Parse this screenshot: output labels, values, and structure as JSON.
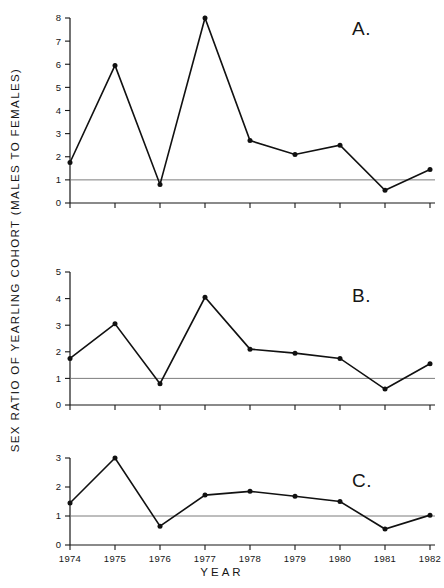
{
  "figure": {
    "ylabel": "SEX RATIO OF YEARLING COHORT (MALES TO FEMALES)",
    "xlabel": "YEAR",
    "panel_a_letter": "A.",
    "panel_b_letter": "B.",
    "panel_c_letter": "C."
  },
  "chart_data": [
    {
      "type": "line",
      "title": "A.",
      "xlabel": "YEAR",
      "ylabel": "SEX RATIO OF YEARLING COHORT (MALES TO FEMALES)",
      "categories": [
        "1974",
        "1975",
        "1976",
        "1977",
        "1978",
        "1979",
        "1980",
        "1981",
        "1982"
      ],
      "x": [
        1974,
        1975,
        1976,
        1977,
        1978,
        1979,
        1980,
        1981,
        1982
      ],
      "values": [
        1.75,
        5.95,
        0.8,
        8.0,
        2.7,
        2.1,
        2.5,
        0.55,
        1.45
      ],
      "ylim": [
        0,
        8
      ],
      "yticks": [
        0,
        1,
        2,
        3,
        4,
        5,
        6,
        7,
        8
      ],
      "ytick_labels": [
        "0",
        "1",
        "2",
        "3",
        "4",
        "5",
        "6",
        "7",
        "8"
      ],
      "reference_line": 1,
      "grid": false,
      "legend": "none",
      "markers": "filled-circle"
    },
    {
      "type": "line",
      "title": "B.",
      "xlabel": "YEAR",
      "ylabel": "SEX RATIO OF YEARLING COHORT (MALES TO FEMALES)",
      "categories": [
        "1974",
        "1975",
        "1976",
        "1977",
        "1978",
        "1979",
        "1980",
        "1981",
        "1982"
      ],
      "x": [
        1974,
        1975,
        1976,
        1977,
        1978,
        1979,
        1980,
        1981,
        1982
      ],
      "values": [
        1.75,
        3.05,
        0.8,
        4.05,
        2.1,
        1.95,
        1.75,
        0.6,
        1.55
      ],
      "ylim": [
        0,
        5
      ],
      "yticks": [
        0,
        1,
        2,
        3,
        4,
        5
      ],
      "ytick_labels": [
        "0",
        "1",
        "2",
        "3",
        "4",
        "5"
      ],
      "reference_line": 1,
      "grid": false,
      "legend": "none",
      "markers": "filled-circle"
    },
    {
      "type": "line",
      "title": "C.",
      "xlabel": "YEAR",
      "ylabel": "SEX RATIO OF YEARLING COHORT (MALES TO FEMALES)",
      "categories": [
        "1974",
        "1975",
        "1976",
        "1977",
        "1978",
        "1979",
        "1980",
        "1981",
        "1982"
      ],
      "x": [
        1974,
        1975,
        1976,
        1977,
        1978,
        1979,
        1980,
        1981,
        1982
      ],
      "values": [
        1.45,
        3.0,
        0.65,
        1.72,
        1.85,
        1.68,
        1.5,
        0.55,
        1.03
      ],
      "ylim": [
        0,
        3
      ],
      "yticks": [
        0,
        1,
        2,
        3
      ],
      "ytick_labels": [
        "0",
        "1",
        "2",
        "3"
      ],
      "reference_line": 1,
      "grid": false,
      "legend": "none",
      "markers": "filled-circle"
    }
  ]
}
